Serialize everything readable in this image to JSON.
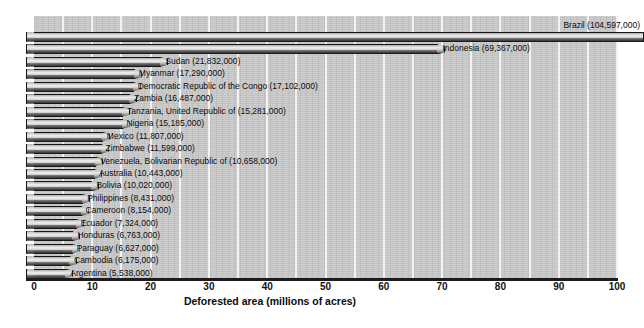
{
  "chart_data": {
    "type": "bar",
    "orientation": "horizontal",
    "title": "",
    "xlabel": "Deforested area (millions of acres)",
    "ylabel": "",
    "xlim": [
      0,
      100
    ],
    "xticks": [
      0,
      10,
      20,
      30,
      40,
      50,
      60,
      70,
      80,
      90,
      100
    ],
    "xtick_labels": [
      "0",
      "10",
      "20",
      "30",
      "40",
      "50",
      "60",
      "70",
      "80",
      "90",
      "100"
    ],
    "grid": "vertical-white-every-5-units",
    "legend": "none",
    "units": "acres",
    "value_scale": 1000000,
    "categories": [
      "Brazil",
      "Indonesia",
      "Sudan",
      "Myanmar",
      "Democratic Republic of the Congo",
      "Zambia",
      "Tanzania, United Republic of",
      "Nigeria",
      "Mexico",
      "Zimbabwe",
      "Venezuela, Bolivarian Republic of",
      "Australia",
      "Bolivia",
      "Philippines",
      "Cameroon",
      "Ecuador",
      "Honduras",
      "Paraguay",
      "Cambodia",
      "Argentina"
    ],
    "values": [
      104597000,
      69367000,
      21832000,
      17290000,
      17102000,
      16487000,
      15281000,
      15185000,
      11807000,
      11599000,
      10658000,
      10443000,
      10020000,
      8431000,
      8154000,
      7324000,
      6763000,
      6627000,
      6175000,
      5538000
    ],
    "values_millions": [
      104.597,
      69.367,
      21.832,
      17.29,
      17.102,
      16.487,
      15.281,
      15.185,
      11.807,
      11.599,
      10.658,
      10.443,
      10.02,
      8.431,
      8.154,
      7.324,
      6.763,
      6.627,
      6.175,
      5.538
    ],
    "bars": [
      {
        "label": "Brazil (104,597,000)",
        "name": "Brazil",
        "value": 104597000,
        "millions": 104.597,
        "label_position": "above",
        "clipped": true
      },
      {
        "label": "Indonesia (69,367,000)",
        "name": "Indonesia",
        "value": 69367000,
        "millions": 69.367,
        "label_position": "right",
        "clipped": false
      },
      {
        "label": "Sudan (21,832,000)",
        "name": "Sudan",
        "value": 21832000,
        "millions": 21.832,
        "label_position": "right",
        "clipped": false
      },
      {
        "label": "Myanmar (17,290,000)",
        "name": "Myanmar",
        "value": 17290000,
        "millions": 17.29,
        "label_position": "right",
        "clipped": false
      },
      {
        "label": "Democratic Republic of the Congo (17,102,000)",
        "name": "Democratic Republic of the Congo",
        "value": 17102000,
        "millions": 17.102,
        "label_position": "right",
        "clipped": false
      },
      {
        "label": "Zambia (16,487,000)",
        "name": "Zambia",
        "value": 16487000,
        "millions": 16.487,
        "label_position": "right",
        "clipped": false
      },
      {
        "label": "Tanzania, United Republic of (15,281,000)",
        "name": "Tanzania, United Republic of",
        "value": 15281000,
        "millions": 15.281,
        "label_position": "right",
        "clipped": false
      },
      {
        "label": "Nigeria (15,185,000)",
        "name": "Nigeria",
        "value": 15185000,
        "millions": 15.185,
        "label_position": "right",
        "clipped": false
      },
      {
        "label": "Mexico (11,807,000)",
        "name": "Mexico",
        "value": 11807000,
        "millions": 11.807,
        "label_position": "right",
        "clipped": false
      },
      {
        "label": "Zimbabwe (11,599,000)",
        "name": "Zimbabwe",
        "value": 11599000,
        "millions": 11.599,
        "label_position": "right",
        "clipped": false
      },
      {
        "label": "Venezuela, Bolivarian Republic of (10,658,000)",
        "name": "Venezuela, Bolivarian Republic of",
        "value": 10658000,
        "millions": 10.658,
        "label_position": "right",
        "clipped": false
      },
      {
        "label": "Australia (10,443,000)",
        "name": "Australia",
        "value": 10443000,
        "millions": 10.443,
        "label_position": "right",
        "clipped": false
      },
      {
        "label": "Bolivia (10,020,000)",
        "name": "Bolivia",
        "value": 10020000,
        "millions": 10.02,
        "label_position": "right",
        "clipped": false
      },
      {
        "label": "Philippines (8,431,000)",
        "name": "Philippines",
        "value": 8431000,
        "millions": 8.431,
        "label_position": "right",
        "clipped": false
      },
      {
        "label": "Cameroon (8,154,000)",
        "name": "Cameroon",
        "value": 8154000,
        "millions": 8.154,
        "label_position": "right",
        "clipped": false
      },
      {
        "label": "Ecuador (7,324,000)",
        "name": "Ecuador",
        "value": 7324000,
        "millions": 7.324,
        "label_position": "right",
        "clipped": false
      },
      {
        "label": "Honduras (6,763,000)",
        "name": "Honduras",
        "value": 6763000,
        "millions": 6.763,
        "label_position": "right",
        "clipped": false
      },
      {
        "label": "Paraguay (6,627,000)",
        "name": "Paraguay",
        "value": 6627000,
        "millions": 6.627,
        "label_position": "right",
        "clipped": false
      },
      {
        "label": "Cambodia (6,175,000)",
        "name": "Cambodia",
        "value": 6175000,
        "millions": 6.175,
        "label_position": "right",
        "clipped": false
      },
      {
        "label": "Argentina (5,538,000)",
        "name": "Argentina",
        "value": 5538000,
        "millions": 5.538,
        "label_position": "right",
        "clipped": false
      }
    ],
    "colors": {
      "plot_background": "#c8c8c8",
      "gridline": "#f2f2f2",
      "bar_highlight": "#efefef",
      "bar_shadow": "#555555",
      "bar_outline": "#171717",
      "axis_line": "#1c1c1c",
      "text": "#0b0b0b",
      "page_background": "#ffffff"
    }
  }
}
